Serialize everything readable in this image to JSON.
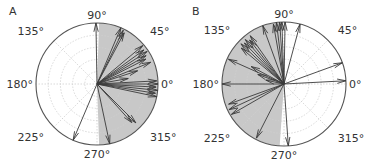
{
  "colors": {
    "shade": "#c8c8c8",
    "arrow": "#3a3a3a",
    "grid": "#cfcfcf",
    "circle": "#555555",
    "text": "#333333"
  },
  "angle_labels": [
    "0°",
    "45°",
    "90°",
    "135°",
    "180°",
    "225°",
    "270°",
    "315°"
  ],
  "chart_data": [
    {
      "type": "polar-quiver",
      "panel_label": "A",
      "title": "",
      "theta_tick_labels": [
        "0°",
        "45°",
        "90°",
        "135°",
        "180°",
        "225°",
        "270°",
        "315°"
      ],
      "r_grid_rings": 4,
      "rlim": [
        0,
        1
      ],
      "shaded_sector_deg": [
        -88,
        88
      ],
      "vectors": [
        {
          "theta": 91,
          "r": 1.0
        },
        {
          "theta": 67,
          "r": 1.0
        },
        {
          "theta": 64,
          "r": 0.98
        },
        {
          "theta": 62,
          "r": 0.95
        },
        {
          "theta": 40,
          "r": 0.98
        },
        {
          "theta": 36,
          "r": 0.95
        },
        {
          "theta": 33,
          "r": 0.98
        },
        {
          "theta": 30,
          "r": 0.93
        },
        {
          "theta": 27,
          "r": 0.9
        },
        {
          "theta": 22,
          "r": 0.95
        },
        {
          "theta": 18,
          "r": 0.7
        },
        {
          "theta": 10,
          "r": 0.52
        },
        {
          "theta": 3,
          "r": 0.98
        },
        {
          "theta": 0,
          "r": 1.0
        },
        {
          "theta": -3,
          "r": 0.97
        },
        {
          "theta": -6,
          "r": 1.0
        },
        {
          "theta": -9,
          "r": 0.97
        },
        {
          "theta": -12,
          "r": 1.0
        },
        {
          "theta": -45,
          "r": 0.9
        },
        {
          "theta": -48,
          "r": 0.85
        },
        {
          "theta": -78,
          "r": 1.0
        },
        {
          "theta": 247,
          "r": 1.0
        }
      ]
    },
    {
      "type": "polar-quiver",
      "panel_label": "B",
      "title": "",
      "theta_tick_labels": [
        "0°",
        "45°",
        "90°",
        "135°",
        "180°",
        "225°",
        "270°",
        "315°"
      ],
      "r_grid_rings": 4,
      "rlim": [
        0,
        1
      ],
      "shaded_sector_deg": [
        94,
        266
      ],
      "vectors": [
        {
          "theta": 3,
          "r": 1.0
        },
        {
          "theta": 20,
          "r": 1.0
        },
        {
          "theta": 75,
          "r": 1.0
        },
        {
          "theta": 89,
          "r": 1.0
        },
        {
          "theta": 92,
          "r": 1.0
        },
        {
          "theta": 94,
          "r": 1.0
        },
        {
          "theta": 97,
          "r": 1.0
        },
        {
          "theta": 100,
          "r": 0.98
        },
        {
          "theta": 110,
          "r": 1.0
        },
        {
          "theta": 125,
          "r": 0.95
        },
        {
          "theta": 128,
          "r": 0.9
        },
        {
          "theta": 131,
          "r": 0.95
        },
        {
          "theta": 134,
          "r": 0.92
        },
        {
          "theta": 137,
          "r": 0.95
        },
        {
          "theta": 140,
          "r": 0.9
        },
        {
          "theta": 152,
          "r": 0.6
        },
        {
          "theta": 156,
          "r": 0.98
        },
        {
          "theta": 160,
          "r": 0.45
        },
        {
          "theta": 168,
          "r": 0.3
        },
        {
          "theta": 180,
          "r": 1.0
        },
        {
          "theta": 200,
          "r": 0.95
        },
        {
          "theta": 205,
          "r": 0.98
        },
        {
          "theta": 210,
          "r": 0.98
        },
        {
          "theta": 243,
          "r": 0.98
        },
        {
          "theta": 274,
          "r": 1.0
        }
      ]
    }
  ]
}
